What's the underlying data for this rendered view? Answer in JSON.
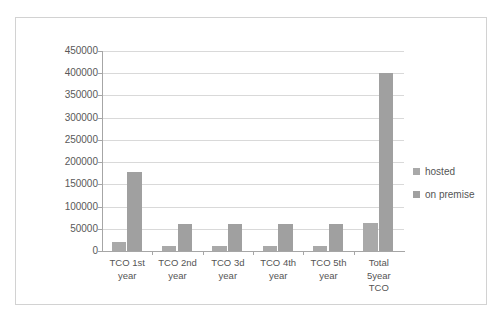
{
  "top_sliver_text": "· ·",
  "chart_data": {
    "type": "bar",
    "title": "",
    "subtitle": "",
    "xlabel": "",
    "ylabel": "",
    "categories": [
      "TCO 1st year",
      "TCO 2nd year",
      "TCO 3d year",
      "TCO 4th year",
      "TCO 5th year",
      "Total 5year TCO"
    ],
    "category_lines": [
      [
        "TCO 1st",
        "year"
      ],
      [
        "TCO 2nd",
        "year"
      ],
      [
        "TCO 3d",
        "year"
      ],
      [
        "TCO 4th",
        "year"
      ],
      [
        "TCO 5th",
        "year"
      ],
      [
        "Total",
        "5year",
        "TCO"
      ]
    ],
    "series": [
      {
        "name": "hosted",
        "color": "#a9a9a9",
        "values": [
          20000,
          12000,
          12000,
          11000,
          11000,
          64000
        ]
      },
      {
        "name": "on premise",
        "color": "#a0a0a0",
        "values": [
          178000,
          61000,
          61000,
          60000,
          60000,
          400000
        ]
      }
    ],
    "ylim": [
      0,
      450000
    ],
    "ytick_step": 50000,
    "yticks": [
      "450000",
      "400000",
      "350000",
      "300000",
      "250000",
      "200000",
      "150000",
      "100000",
      "50000",
      "0"
    ],
    "grid": true,
    "legend_position": "right",
    "legend_entries": [
      "hosted",
      "on premise"
    ],
    "plot_bg": "#ffffff",
    "grid_color": "#d9d9d9",
    "axis_color": "#a6a6a6",
    "frame_color": "#d2d2d2",
    "text_color": "#555555"
  }
}
